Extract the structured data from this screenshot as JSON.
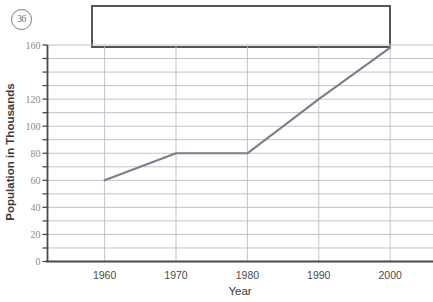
{
  "page": {
    "problem_number": "36",
    "answer_box_value": ""
  },
  "chart_data": {
    "type": "line",
    "title": "",
    "xlabel": "Year",
    "ylabel": "Population in Thousands",
    "x": [
      1960,
      1970,
      1980,
      1990,
      2000
    ],
    "categories": [
      "1960",
      "1970",
      "1980",
      "1990",
      "2000"
    ],
    "values": [
      60,
      80,
      80,
      120,
      158
    ],
    "series": [
      {
        "name": "Population",
        "values": [
          60,
          80,
          80,
          120,
          158
        ]
      }
    ],
    "xtick_labels": [
      "1960",
      "1970",
      "1980",
      "1990",
      "2000"
    ],
    "ytick_labels": [
      "160",
      "120",
      "100",
      "80",
      "60",
      "40",
      "20",
      "0"
    ],
    "ytick_values": [
      160,
      120,
      100,
      80,
      60,
      40,
      20,
      0
    ],
    "ylim": [
      0,
      160
    ],
    "xlim": [
      1952,
      2006
    ],
    "grid": true,
    "grid_step": 10,
    "legend": "none",
    "line_color": "#7a7f8c",
    "grid_color": "#b9bcc4",
    "axis_color": "#4a4a4a"
  }
}
